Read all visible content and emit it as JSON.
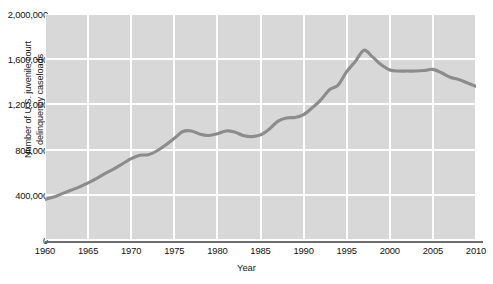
{
  "chart_data": {
    "type": "line",
    "title": "",
    "xlabel": "Year",
    "ylabel": "Number of U.S. juvenile court delinquency caseloads",
    "ylabel_lines": [
      "Number of U.S. juvenile court",
      "delinquency caseloads"
    ],
    "xlim": [
      1960,
      2010
    ],
    "ylim": [
      0,
      2000000
    ],
    "grid": true,
    "legend": false,
    "legend_position": "none",
    "series_color": "#8c8c8c",
    "plot_background": "#d8d8d8",
    "gridline_color": "#ffffff",
    "axis_color": "#6d6d6d",
    "ytick_labels": [
      "2,000,000",
      "1,600,000",
      "1,200,000",
      "800,000",
      "400,000",
      "0"
    ],
    "ytick_values": [
      2000000,
      1600000,
      1200000,
      800000,
      400000,
      0
    ],
    "xtick_labels": [
      "1960",
      "1965",
      "1970",
      "1975",
      "1980",
      "1985",
      "1990",
      "1995",
      "2000",
      "2005",
      "2010"
    ],
    "xtick_values": [
      1960,
      1965,
      1970,
      1975,
      1980,
      1985,
      1990,
      1995,
      2000,
      2005,
      2010
    ],
    "x": [
      1960,
      1961,
      1962,
      1963,
      1964,
      1965,
      1966,
      1967,
      1968,
      1969,
      1970,
      1971,
      1972,
      1973,
      1974,
      1975,
      1976,
      1977,
      1978,
      1979,
      1980,
      1981,
      1982,
      1983,
      1984,
      1985,
      1986,
      1987,
      1988,
      1989,
      1990,
      1991,
      1992,
      1993,
      1994,
      1995,
      1996,
      1997,
      1998,
      1999,
      2000,
      2001,
      2002,
      2003,
      2004,
      2005,
      2006,
      2007,
      2008,
      2009,
      2010
    ],
    "values": [
      360000,
      380000,
      410000,
      440000,
      470000,
      505000,
      545000,
      590000,
      630000,
      675000,
      720000,
      750000,
      755000,
      790000,
      840000,
      900000,
      960000,
      965000,
      935000,
      925000,
      940000,
      965000,
      955000,
      925000,
      915000,
      930000,
      980000,
      1050000,
      1080000,
      1085000,
      1110000,
      1170000,
      1240000,
      1330000,
      1370000,
      1490000,
      1580000,
      1680000,
      1620000,
      1550000,
      1505000,
      1495000,
      1495000,
      1495000,
      1500000,
      1510000,
      1480000,
      1440000,
      1420000,
      1390000,
      1360000
    ]
  }
}
